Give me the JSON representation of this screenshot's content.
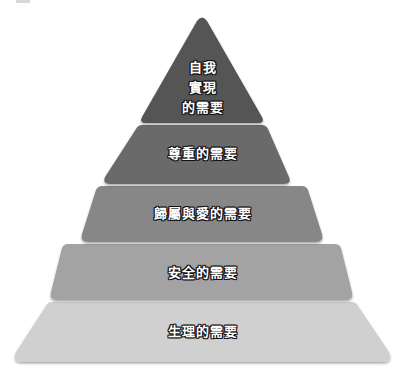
{
  "diagram": {
    "type": "pyramid",
    "levels": [
      {
        "label_lines": [
          "自我",
          "實現",
          "的需要"
        ],
        "label": "自我實現的需要",
        "color": "#545454"
      },
      {
        "label": "尊重的需要",
        "color": "#6b6b6b"
      },
      {
        "label": "歸屬與愛的需要",
        "color": "#878787"
      },
      {
        "label": "安全的需要",
        "color": "#a3a3a3"
      },
      {
        "label": "生理的需要",
        "color": "#d0d0d0"
      }
    ]
  }
}
